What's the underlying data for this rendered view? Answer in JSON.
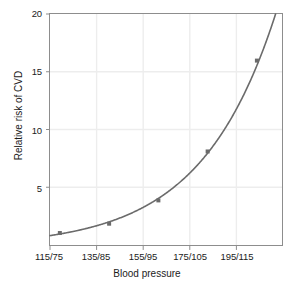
{
  "figure": {
    "title": "",
    "background_color": "#ffffff",
    "width": 294,
    "height": 290
  },
  "axes": {
    "x_label": "Blood pressure",
    "y_label": "Relative risk of CVD",
    "x_tick_labels": [
      "115/75",
      "135/85",
      "155/95",
      "175/105",
      "195/115"
    ],
    "y_tick_labels": [
      "5",
      "10",
      "15",
      "20"
    ],
    "axis_color": "#8d8d8d",
    "grid_color": "#ededed",
    "tick_text_color": "#1b1b1b"
  },
  "chart_data": {
    "type": "line",
    "title": "",
    "xlabel": "Blood pressure",
    "ylabel": "Relative risk of CVD",
    "categories": [
      "115/75",
      "135/85",
      "155/95",
      "175/105",
      "195/115"
    ],
    "x": [
      115,
      135,
      155,
      175,
      195
    ],
    "values": [
      1.2,
      2.0,
      4.0,
      8.2,
      16.0
    ],
    "series": [
      {
        "name": "Relative risk of CVD",
        "values": [
          1.2,
          2.0,
          4.0,
          8.2,
          16.0
        ],
        "line_color": "#6b6b6b",
        "marker": "square",
        "marker_color": "#6b6b6b"
      }
    ],
    "ylim": [
      0,
      20
    ],
    "yticks": [
      5,
      10,
      15,
      20
    ],
    "xlim": [
      111,
      206
    ],
    "xticks": [
      115,
      135,
      155,
      175,
      195
    ],
    "grid": true,
    "legend": false
  }
}
